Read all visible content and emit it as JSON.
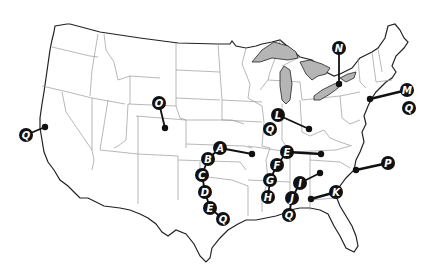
{
  "map": {
    "type": "us-states-outline",
    "colors": {
      "background": "#ffffff",
      "state_border": "#9a9a9a",
      "coast": "#222222",
      "lakes": "#b5b5b5",
      "marker": "#111111",
      "marker_text": "#ffffff"
    }
  },
  "markers": [
    {
      "id": "O",
      "label": "O",
      "lx": 159,
      "ly": 103,
      "dx": 165,
      "dy": 128,
      "place": "Colorado"
    },
    {
      "id": "Q-west",
      "label": "Q",
      "lx": 26,
      "ly": 135,
      "dx": 45,
      "dy": 127,
      "place": "California coast"
    },
    {
      "id": "A",
      "label": "A",
      "lx": 220,
      "ly": 148,
      "dx": 252,
      "dy": 154
    },
    {
      "id": "B",
      "label": "B",
      "lx": 208,
      "ly": 159
    },
    {
      "id": "C",
      "label": "C",
      "lx": 202,
      "ly": 175
    },
    {
      "id": "D",
      "label": "D",
      "lx": 205,
      "ly": 192
    },
    {
      "id": "E-west",
      "label": "E",
      "lx": 210,
      "ly": 208
    },
    {
      "id": "Q-texas",
      "label": "Q",
      "lx": 223,
      "ly": 219
    },
    {
      "id": "L",
      "label": "L",
      "lx": 278,
      "ly": 115,
      "dx": 309,
      "dy": 129
    },
    {
      "id": "Q-l",
      "label": "Q",
      "lx": 270,
      "ly": 129
    },
    {
      "id": "E-east",
      "label": "E",
      "lx": 287,
      "ly": 152,
      "dx": 321,
      "dy": 154
    },
    {
      "id": "F",
      "label": "F",
      "lx": 277,
      "ly": 165
    },
    {
      "id": "G",
      "label": "G",
      "lx": 270,
      "ly": 180
    },
    {
      "id": "H",
      "label": "H",
      "lx": 268,
      "ly": 197
    },
    {
      "id": "I",
      "label": "I",
      "lx": 300,
      "ly": 183,
      "dx": 320,
      "dy": 173
    },
    {
      "id": "J",
      "label": "J",
      "lx": 292,
      "ly": 198
    },
    {
      "id": "Q-gulf",
      "label": "Q",
      "lx": 289,
      "ly": 215
    },
    {
      "id": "K",
      "label": "K",
      "lx": 336,
      "ly": 192,
      "dx": 311,
      "dy": 199
    },
    {
      "id": "P",
      "label": "P",
      "lx": 388,
      "ly": 163,
      "dx": 356,
      "dy": 170
    },
    {
      "id": "M",
      "label": "M",
      "lx": 407,
      "ly": 90,
      "dx": 370,
      "dy": 99
    },
    {
      "id": "Q-east",
      "label": "Q",
      "lx": 409,
      "ly": 108
    },
    {
      "id": "N",
      "label": "N",
      "lx": 339,
      "ly": 48,
      "dx": 339,
      "dy": 84
    }
  ]
}
